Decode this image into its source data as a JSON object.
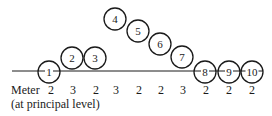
{
  "diagram": {
    "baseline": {
      "x1": 12,
      "x2": 262,
      "y": 71
    },
    "circle_radius": 11,
    "nodes": [
      {
        "label": "1",
        "cx": 49,
        "cy": 72
      },
      {
        "label": "2",
        "cx": 72,
        "cy": 58
      },
      {
        "label": "3",
        "cx": 95,
        "cy": 58
      },
      {
        "label": "4",
        "cx": 115,
        "cy": 19
      },
      {
        "label": "5",
        "cx": 138,
        "cy": 31
      },
      {
        "label": "6",
        "cx": 160,
        "cy": 44
      },
      {
        "label": "7",
        "cx": 182,
        "cy": 57
      },
      {
        "label": "8",
        "cx": 205,
        "cy": 72
      },
      {
        "label": "9",
        "cx": 229,
        "cy": 72
      },
      {
        "label": "10",
        "cx": 252,
        "cy": 72
      }
    ]
  },
  "meter": {
    "label": "Meter",
    "sublabel": "(at principal level)",
    "values": [
      "2",
      "3",
      "2",
      "3",
      "2",
      "2",
      "3",
      "2",
      "2",
      "2"
    ],
    "positions": [
      51,
      73,
      96,
      116,
      139,
      161,
      183,
      206,
      229,
      252
    ]
  }
}
